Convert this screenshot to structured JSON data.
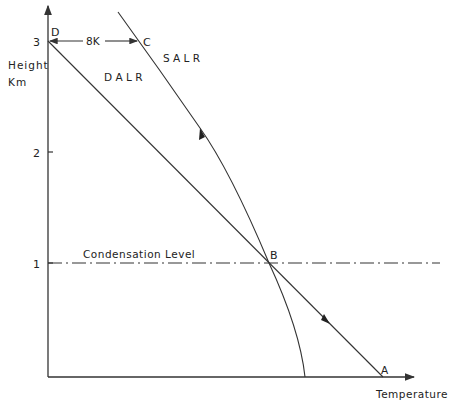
{
  "diagram": {
    "type": "lapse-rate-diagram",
    "axes": {
      "y_label_line1": "Height",
      "y_label_line2": "Km",
      "x_label": "Temperature",
      "y_ticks": [
        "1",
        "2",
        "3"
      ]
    },
    "points": {
      "A": "A",
      "B": "B",
      "C": "C",
      "D": "D"
    },
    "labels": {
      "dalr": "D A L R",
      "salr": "S A L R",
      "difference": "8K",
      "condensation_level": "Condensation Level"
    },
    "colors": {
      "line": "#333333",
      "background": "#ffffff"
    }
  }
}
